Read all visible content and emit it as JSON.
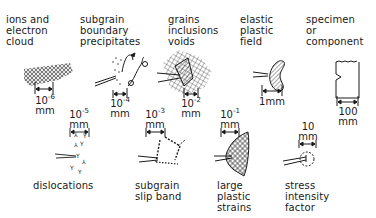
{
  "diagram": {
    "top_row": [
      {
        "label": "ions and\nelectron\ncloud",
        "scale_base": "10",
        "scale_exp": "-6",
        "unit": "mm"
      },
      {
        "label": "subgrain\nboundary\nprecipitates",
        "scale_base": "10",
        "scale_exp": "-4",
        "unit": "mm"
      },
      {
        "label": "grains\ninclusions\nvoids",
        "scale_base": "10",
        "scale_exp": "-2",
        "unit": "mm"
      },
      {
        "label": "elastic\nplastic\nfield",
        "scale_base": "1mm",
        "scale_exp": "",
        "unit": ""
      },
      {
        "label": "specimen\nor\ncomponent",
        "scale_base": "100",
        "scale_exp": "",
        "unit": "mm"
      }
    ],
    "bottom_row": [
      {
        "label": "dislocations",
        "scale_base": "10",
        "scale_exp": "-5",
        "unit": "mm"
      },
      {
        "label": "subgrain\nslip band",
        "scale_base": "10",
        "scale_exp": "-3",
        "unit": "mm"
      },
      {
        "label": "large\nplastic\nstrains",
        "scale_base": "10",
        "scale_exp": "-1",
        "unit": "mm"
      },
      {
        "label": "stress\nintensity\nfactor",
        "scale_base": "10",
        "scale_exp": "",
        "unit": "mm"
      }
    ],
    "colors": {
      "ink": "#1a1a1a",
      "background": "#ffffff"
    }
  }
}
